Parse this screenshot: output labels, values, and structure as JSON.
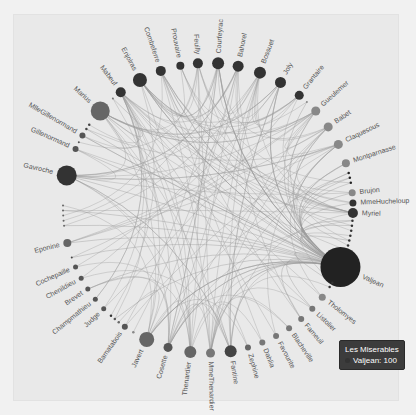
{
  "chart_data": {
    "type": "graph",
    "layout": "circular",
    "title": "Les Miserables",
    "series_name": "Les Miserables",
    "center": [
      208,
      208
    ],
    "radius": 145,
    "nodes": [
      {
        "name": "Myriel",
        "angle": 2,
        "size": 10,
        "color": "#333333",
        "label": true
      },
      {
        "name": "",
        "angle": 5,
        "size": 2.5,
        "color": "#333333",
        "label": false
      },
      {
        "name": "",
        "angle": 7,
        "size": 2.5,
        "color": "#333333",
        "label": false
      },
      {
        "name": "",
        "angle": 9,
        "size": 2.5,
        "color": "#333333",
        "label": false
      },
      {
        "name": "",
        "angle": 11,
        "size": 2.5,
        "color": "#333333",
        "label": false
      },
      {
        "name": "",
        "angle": 13,
        "size": 2.5,
        "color": "#333333",
        "label": false
      },
      {
        "name": "",
        "angle": 15,
        "size": 2.5,
        "color": "#333333",
        "label": false
      },
      {
        "name": "",
        "angle": 17,
        "size": 2.5,
        "color": "#333333",
        "label": false
      },
      {
        "name": "Valjean",
        "angle": 24,
        "size": 40,
        "color": "#222222",
        "label": true
      },
      {
        "name": "",
        "angle": 31,
        "size": 2.5,
        "color": "#333333",
        "label": false
      },
      {
        "name": "",
        "angle": 33,
        "size": 2.5,
        "color": "#333333",
        "label": false
      },
      {
        "name": "Thenardier",
        "angle": 38,
        "size": 7,
        "color": "#888888",
        "label": true,
        "display": "Tholomyes"
      },
      {
        "name": "Listolier",
        "angle": 44,
        "size": 6,
        "color": "#777777",
        "label": true
      },
      {
        "name": "Fameuil",
        "angle": 50,
        "size": 6,
        "color": "#777777",
        "label": true
      },
      {
        "name": "Blacheville",
        "angle": 56,
        "size": 6,
        "color": "#777777",
        "label": true
      },
      {
        "name": "Favourite",
        "angle": 62,
        "size": 6,
        "color": "#777777",
        "label": true
      },
      {
        "name": "Dahlia",
        "angle": 68,
        "size": 6,
        "color": "#777777",
        "label": true
      },
      {
        "name": "Zephine",
        "angle": 74,
        "size": 6,
        "color": "#666666",
        "label": true
      },
      {
        "name": "Fantine",
        "angle": 81,
        "size": 12,
        "color": "#444444",
        "label": true
      },
      {
        "name": "MmeThenardier",
        "angle": 89,
        "size": 9,
        "color": "#777777",
        "label": true
      },
      {
        "name": "Thenardier",
        "angle": 97,
        "size": 12,
        "color": "#666666",
        "label": true
      },
      {
        "name": "Cosette",
        "angle": 106,
        "size": 9,
        "color": "#555555",
        "label": true
      },
      {
        "name": "Javert",
        "angle": 115,
        "size": 15,
        "color": "#666666",
        "label": true
      },
      {
        "name": "",
        "angle": 121,
        "size": 2.5,
        "color": "#888888",
        "label": false
      },
      {
        "name": "Bamatabois",
        "angle": 125,
        "size": 6,
        "color": "#555555",
        "label": true
      },
      {
        "name": "",
        "angle": 128,
        "size": 2.5,
        "color": "#666666",
        "label": false
      },
      {
        "name": "",
        "angle": 130,
        "size": 2.5,
        "color": "#555555",
        "label": false
      },
      {
        "name": "",
        "angle": 132,
        "size": 2.5,
        "color": "#333333",
        "label": false
      },
      {
        "name": "Judge",
        "angle": 136,
        "size": 5,
        "color": "#555555",
        "label": true
      },
      {
        "name": "Champmathieu",
        "angle": 141,
        "size": 5,
        "color": "#555555",
        "label": true
      },
      {
        "name": "Brevet",
        "angle": 146,
        "size": 5,
        "color": "#555555",
        "label": true
      },
      {
        "name": "Chenildieu",
        "angle": 151,
        "size": 5,
        "color": "#555555",
        "label": true
      },
      {
        "name": "Cochepaille",
        "angle": 156,
        "size": 5,
        "color": "#555555",
        "label": true
      },
      {
        "name": "",
        "angle": 160,
        "size": 2,
        "color": "#444444",
        "label": false
      },
      {
        "name": "Eponine",
        "angle": 166,
        "size": 8,
        "color": "#666666",
        "label": true
      },
      {
        "name": "",
        "angle": 173,
        "size": 2,
        "color": "#666666",
        "label": false
      },
      {
        "name": "",
        "angle": 175,
        "size": 2,
        "color": "#666666",
        "label": false
      },
      {
        "name": "",
        "angle": 177,
        "size": 2,
        "color": "#666666",
        "label": false
      },
      {
        "name": "",
        "angle": 179,
        "size": 2,
        "color": "#666666",
        "label": false
      },
      {
        "name": "",
        "angle": 181,
        "size": 2,
        "color": "#666666",
        "label": false
      },
      {
        "name": "Gavroche",
        "angle": 193,
        "size": 20,
        "color": "#333333",
        "label": true
      },
      {
        "name": "Gillenormand",
        "angle": 204,
        "size": 6,
        "color": "#555555",
        "label": true
      },
      {
        "name": "",
        "angle": 207,
        "size": 2,
        "color": "#555555",
        "label": false
      },
      {
        "name": "MlleGillenormand",
        "angle": 210,
        "size": 6,
        "color": "#555555",
        "label": true
      },
      {
        "name": "",
        "angle": 213,
        "size": 2.5,
        "color": "#444444",
        "label": false
      },
      {
        "name": "",
        "angle": 215,
        "size": 2.5,
        "color": "#444444",
        "label": false
      },
      {
        "name": "Marius",
        "angle": 222,
        "size": 19,
        "color": "#666666",
        "label": true
      },
      {
        "name": "",
        "angle": 229,
        "size": 2,
        "color": "#777777",
        "label": false
      },
      {
        "name": "Mabeuf",
        "angle": 233,
        "size": 10,
        "color": "#333333",
        "label": true
      },
      {
        "name": "Enjolras",
        "angle": 242,
        "size": 14,
        "color": "#333333",
        "label": true
      },
      {
        "name": "Combeferre",
        "angle": 251,
        "size": 10,
        "color": "#333333",
        "label": true
      },
      {
        "name": "Prouvaire",
        "angle": 259,
        "size": 8,
        "color": "#333333",
        "label": true
      },
      {
        "name": "Feuilly",
        "angle": 266,
        "size": 10,
        "color": "#333333",
        "label": true
      },
      {
        "name": "Courfeyrac",
        "angle": 274,
        "size": 12,
        "color": "#333333",
        "label": true
      },
      {
        "name": "Bahorel",
        "angle": 282,
        "size": 11,
        "color": "#333333",
        "label": true
      },
      {
        "name": "Bossuet",
        "angle": 291,
        "size": 12,
        "color": "#333333",
        "label": true
      },
      {
        "name": "Joly",
        "angle": 300,
        "size": 11,
        "color": "#333333",
        "label": true
      },
      {
        "name": "Grantaire",
        "angle": 309,
        "size": 9,
        "color": "#333333",
        "label": true
      },
      {
        "name": "",
        "angle": 313,
        "size": 2,
        "color": "#888888",
        "label": false
      },
      {
        "name": "Gueulemer",
        "angle": 318,
        "size": 9,
        "color": "#888888",
        "label": true
      },
      {
        "name": "Babet",
        "angle": 326,
        "size": 9,
        "color": "#888888",
        "label": true
      },
      {
        "name": "Claquesous",
        "angle": 334,
        "size": 9,
        "color": "#888888",
        "label": true
      },
      {
        "name": "Montparnasse",
        "angle": 342,
        "size": 8,
        "color": "#888888",
        "label": true
      },
      {
        "name": "",
        "angle": 346,
        "size": 2.5,
        "color": "#222222",
        "label": false
      },
      {
        "name": "",
        "angle": 348,
        "size": 2.5,
        "color": "#222222",
        "label": false
      },
      {
        "name": "",
        "angle": 350,
        "size": 2.5,
        "color": "#222222",
        "label": false
      },
      {
        "name": "Brujon",
        "angle": 354,
        "size": 7,
        "color": "#888888",
        "label": true
      },
      {
        "name": "MmeHucheloup",
        "angle": 358,
        "size": 7,
        "color": "#333333",
        "label": true
      }
    ],
    "visible_labels": [
      "Myriel",
      "Valjean",
      "Tholomyes",
      "Listolier",
      "Fameuil",
      "Blacheville",
      "Favourite",
      "Dahlia",
      "Zephine",
      "Fantine",
      "MmeThenardier",
      "Thenardier",
      "Cosette",
      "Javert",
      "Bamatabois",
      "Judge",
      "Champmathieu",
      "Brevet",
      "Chenildieu",
      "Cochepaille",
      "Eponine",
      "Gavroche",
      "Gillenormand",
      "MlleGillenormand",
      "Marius",
      "Mabeuf",
      "Enjolras",
      "Combeferre",
      "Prouvaire",
      "Feuilly",
      "Courfeyrac",
      "Bahorel",
      "Bossuet",
      "Joly",
      "Grantaire",
      "Gueulemer",
      "Babet",
      "Claquesous",
      "Montparnasse",
      "Brujon",
      "MmeHucheloup"
    ],
    "edge_color": "#999999",
    "edge_style": "curved",
    "legend": "none"
  },
  "tooltip": {
    "title": "Les Miserables",
    "item_name": "Valjean",
    "item_value": "100",
    "item_text": "Valjean: 100"
  },
  "colors": {
    "page_bg": "#f1f1f1",
    "panel_bg": "#e9e9e9",
    "tooltip_bg": "#3c3c3c"
  }
}
